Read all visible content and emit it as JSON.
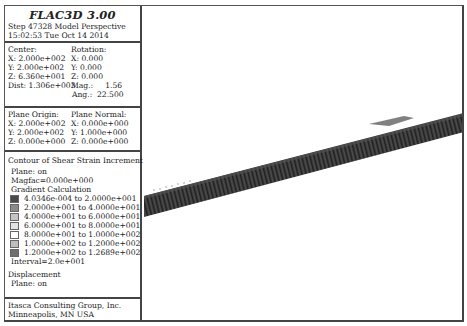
{
  "header": {
    "app_title": "FLAC3D 3.00",
    "step_line": "Step 47328 Model Perspective",
    "timestamp": "15:02:53 Tue Oct 14 2014"
  },
  "view_params": {
    "center_label": "Center:",
    "center": {
      "x": "X: 2.000e+002",
      "y": "Y: 2.000e+002",
      "z": "Z: 6.360e+001"
    },
    "dist": "Dist: 1.306e+003",
    "rotation_label": "Rotation:",
    "rotation": {
      "x": "X: 0.000",
      "y": "Y: 0.000",
      "z": "Z: 0.000"
    },
    "mag": "Mag.:     1.56",
    "ang": "Ang.:  22.500"
  },
  "plane": {
    "origin_label": "Plane Origin:",
    "origin": {
      "x": "X: 2.000e+002",
      "y": "Y: 2.000e+002",
      "z": "Z: 0.000e+000"
    },
    "normal_label": "Plane Normal:",
    "normal": {
      "x": "X: 0.000e+000",
      "y": "Y: 1.000e+000",
      "z": "Z: 0.000e+000"
    }
  },
  "contour": {
    "title": "Contour of Shear Strain Increment",
    "plane": "Plane: on",
    "magfac": "Magfac=0.000e+000",
    "gradient": "Gradient Calculation",
    "ranges": [
      {
        "label": "4.0346e-004 to 2.0000e+001",
        "color": "#4a4a4a"
      },
      {
        "label": "2.0000e+001 to 4.0000e+001",
        "color": "#8a8a8a"
      },
      {
        "label": "4.0000e+001 to 6.0000e+001",
        "color": "#c4c4c4"
      },
      {
        "label": "6.0000e+001 to 8.0000e+001",
        "color": "#e2e2e2"
      },
      {
        "label": "8.0000e+001 to 1.0000e+002",
        "color": "#ffffff"
      },
      {
        "label": "1.0000e+002 to 1.2000e+002",
        "color": "#bdbdbd"
      },
      {
        "label": "1.2000e+002 to 1.2689e+002",
        "color": "#6e6e6e"
      }
    ],
    "interval": "Interval=2.0e+001"
  },
  "displacement": {
    "title": "Displacement",
    "plane": "Plane: on"
  },
  "footer": {
    "company": "Itasca Consulting Group, Inc.",
    "location": "Minneapolis, MN USA"
  },
  "model_view": {
    "strip_color": "#3c3c3c",
    "strip_polygon": "0,190 324,106 324,125 0,211"
  }
}
